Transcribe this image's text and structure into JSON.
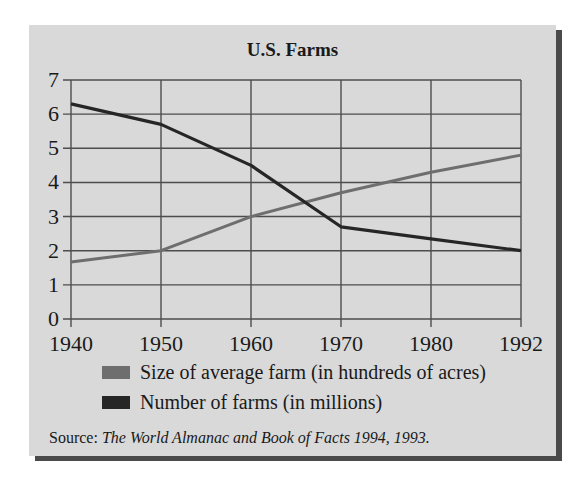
{
  "chart_data": {
    "type": "line",
    "title": "U.S. Farms",
    "xlabel": "",
    "ylabel": "",
    "categories": [
      "1940",
      "1950",
      "1960",
      "1970",
      "1980",
      "1992"
    ],
    "yticks": [
      "0",
      "1",
      "2",
      "3",
      "4",
      "5",
      "6",
      "7"
    ],
    "ylim": [
      0,
      7
    ],
    "grid": true,
    "legend_position": "bottom",
    "series": [
      {
        "name": "Size of average farm (in hundreds of acres)",
        "color": "#6e6e6e",
        "values": [
          1.67,
          2.0,
          3.0,
          3.7,
          4.3,
          4.8
        ]
      },
      {
        "name": "Number of farms (in millions)",
        "color": "#262626",
        "values": [
          6.3,
          5.7,
          4.5,
          2.7,
          2.35,
          2.0
        ]
      }
    ],
    "source_prefix": "Source: ",
    "source_title": "The World Almanac and Book of Facts 1994, 1993."
  },
  "colors": {
    "panel": "#d9d9d9",
    "shadow": "#4a4a4a",
    "grid": "#4d4d4d"
  }
}
